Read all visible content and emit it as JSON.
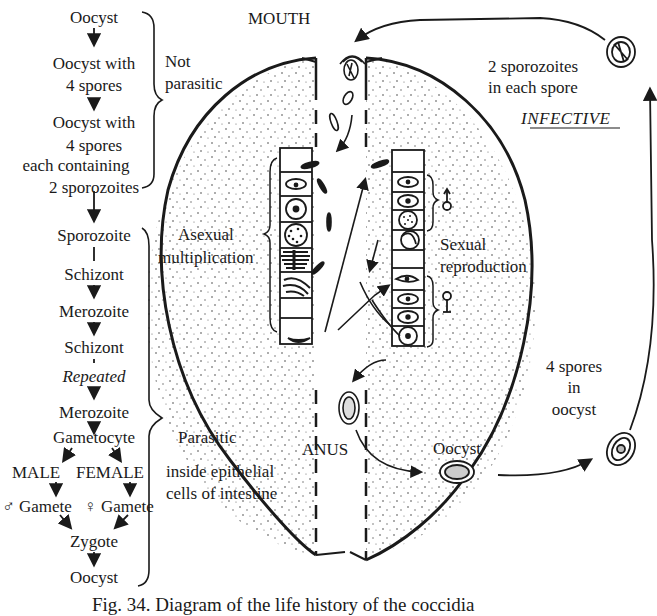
{
  "figure": {
    "caption": "Fig. 34. Diagram of the life history of the coccidia"
  },
  "left_flow": {
    "not_parasitic_steps": [
      "Oocyst",
      "Oocyst with",
      "4 spores",
      "Oocyst with",
      "4 spores",
      "each containing",
      "2 sporozoites"
    ],
    "not_parasitic_label": [
      "Not",
      "parasitic"
    ],
    "parasitic_steps": [
      "Sporozoite",
      "Schizont",
      "Merozoite",
      "Schizont",
      "Repeated",
      "Merozoite",
      "Gametocyte"
    ],
    "male_label": "MALE",
    "female_label": "FEMALE",
    "male_gamete": "♂ Gamete",
    "female_gamete": "♀ Gamete",
    "zygote": "Zygote",
    "final_oocyst": "Oocyst",
    "parasitic_label": "Parasitic",
    "parasitic_note": [
      "inside epithelial",
      "cells of intestine"
    ]
  },
  "gut": {
    "mouth_label": "MOUTH",
    "anus_label": "ANUS",
    "asexual_label": [
      "Asexual",
      "multiplication"
    ],
    "sexual_label": [
      "Sexual",
      "reproduction"
    ],
    "male_symbol": "♂",
    "female_symbol": "♀"
  },
  "outside_cycle": {
    "infective_note": [
      "2 sporozoites",
      "in each spore"
    ],
    "infective_label": "INFECTIVE",
    "spores_note": [
      "4 spores",
      "in",
      "oocyst"
    ],
    "oocyst_label": "Oocyst"
  },
  "colors": {
    "ink": "#1a1a1a",
    "paper": "#ffffff"
  }
}
